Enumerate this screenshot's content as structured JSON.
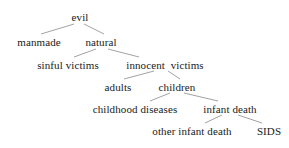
{
  "diagram": {
    "type": "tree",
    "title": "",
    "background_color": "#ffffff",
    "text_color": "#1a1a1a",
    "edge_color": "#8a8a8a",
    "nodes": [
      {
        "id": "evil",
        "label": "evil",
        "level": 0,
        "x": 80,
        "y": 12
      },
      {
        "id": "manmade",
        "label": "manmade",
        "level": 1,
        "x": 39,
        "y": 37
      },
      {
        "id": "natural",
        "label": "natural",
        "level": 1,
        "x": 101,
        "y": 37
      },
      {
        "id": "sinful-victims",
        "label": "sinful victims",
        "level": 2,
        "x": 68,
        "y": 60
      },
      {
        "id": "innocent-victims",
        "label": "innocent  victims",
        "level": 2,
        "x": 165,
        "y": 60
      },
      {
        "id": "adults",
        "label": "adults",
        "level": 3,
        "x": 118,
        "y": 82
      },
      {
        "id": "children",
        "label": "children",
        "level": 3,
        "x": 177,
        "y": 82
      },
      {
        "id": "childhood-diseases",
        "label": "childhood diseases",
        "level": 4,
        "x": 135,
        "y": 104
      },
      {
        "id": "infant-death",
        "label": "infant death",
        "level": 4,
        "x": 230,
        "y": 104
      },
      {
        "id": "other-infant-death",
        "label": "other infant death",
        "level": 5,
        "x": 192,
        "y": 126
      },
      {
        "id": "sids",
        "label": "SIDS",
        "level": 5,
        "x": 269,
        "y": 126
      }
    ],
    "edges": [
      {
        "from": "evil",
        "to": "manmade",
        "x1": 74,
        "y1": 24,
        "x2": 41,
        "y2": 34
      },
      {
        "from": "evil",
        "to": "natural",
        "x1": 84,
        "y1": 24,
        "x2": 104,
        "y2": 34
      },
      {
        "from": "natural",
        "to": "sinful-victims",
        "x1": 96,
        "y1": 49,
        "x2": 74,
        "y2": 57
      },
      {
        "from": "natural",
        "to": "innocent-victims",
        "x1": 108,
        "y1": 49,
        "x2": 139,
        "y2": 57
      },
      {
        "from": "innocent-victims",
        "to": "adults",
        "x1": 154,
        "y1": 71,
        "x2": 124,
        "y2": 79
      },
      {
        "from": "innocent-victims",
        "to": "children",
        "x1": 168,
        "y1": 71,
        "x2": 180,
        "y2": 79
      },
      {
        "from": "children",
        "to": "childhood-diseases",
        "x1": 170,
        "y1": 93,
        "x2": 150,
        "y2": 101
      },
      {
        "from": "children",
        "to": "infant-death",
        "x1": 184,
        "y1": 93,
        "x2": 218,
        "y2": 101
      },
      {
        "from": "infant-death",
        "to": "other-infant-death",
        "x1": 222,
        "y1": 115,
        "x2": 205,
        "y2": 123
      },
      {
        "from": "infant-death",
        "to": "sids",
        "x1": 238,
        "y1": 115,
        "x2": 262,
        "y2": 123
      }
    ]
  }
}
